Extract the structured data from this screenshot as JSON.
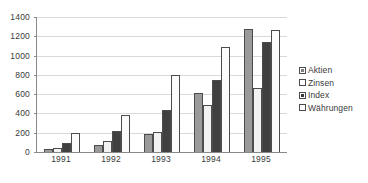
{
  "chart_data": {
    "type": "bar",
    "title": "",
    "subtitle": "",
    "xlabel": "",
    "ylabel": "",
    "categories": [
      "1991",
      "1992",
      "1993",
      "1994",
      "1995"
    ],
    "series": [
      {
        "name": "Aktien",
        "color": "#9a9a9a",
        "values": [
          30,
          70,
          190,
          615,
          1280
        ]
      },
      {
        "name": "Zinsen",
        "color": "#f2f2f2",
        "values": [
          45,
          110,
          205,
          485,
          660
        ]
      },
      {
        "name": "Index",
        "color": "#404040",
        "values": [
          95,
          220,
          435,
          745,
          1140
        ]
      },
      {
        "name": "Währungen",
        "color": "#fbfbfb",
        "values": [
          200,
          380,
          800,
          1090,
          1265
        ]
      }
    ],
    "ylim": [
      0,
      1400
    ],
    "ytick_step": 200,
    "yticks": [
      "0",
      "200",
      "400",
      "600",
      "800",
      "1000",
      "1200",
      "1400"
    ],
    "grid": true,
    "grid_axis": "y",
    "legend_position": "right",
    "bar_border_color": "#4c4c4c",
    "axis_color": "#8a8a8a",
    "gridline_color": "#d9d9d9",
    "text_color": "#3a3a3a",
    "background": "#ffffff"
  }
}
